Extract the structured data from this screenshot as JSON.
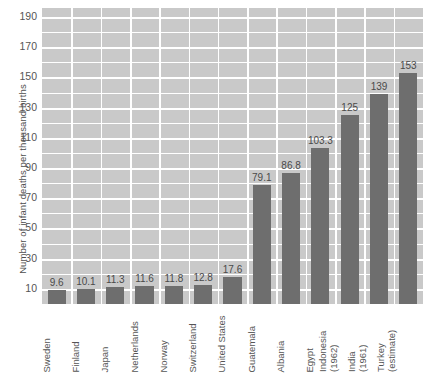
{
  "chart_data": {
    "type": "bar",
    "title": "",
    "xlabel": "",
    "ylabel": "Number of infant deaths per thousand births",
    "ylim": [
      0,
      196
    ],
    "yticks": [
      10,
      30,
      50,
      70,
      90,
      110,
      130,
      150,
      170,
      190
    ],
    "ytick_labels": [
      "10",
      "30",
      "50",
      "70",
      "90",
      "110",
      "130",
      "150",
      "170",
      "190"
    ],
    "minor_tick_step": 10,
    "grid": true,
    "legend": "none",
    "bar_color": "#6e6e6e",
    "plot_background": "#c9c9c9",
    "gridline_color": "#ffffff",
    "categories": [
      "Sweden",
      "Finland",
      "Japan",
      "Netherlands",
      "Norway",
      "Switzerland",
      "United States",
      "Guatemala",
      "Albania",
      "Egypt",
      "Indonesia (1962)",
      "India (1961)",
      "Turkey (estimate)"
    ],
    "category_lines": [
      [
        "Sweden"
      ],
      [
        "Finland"
      ],
      [
        "Japan"
      ],
      [
        "Netherlands"
      ],
      [
        "Norway"
      ],
      [
        "Switzerland"
      ],
      [
        "United States"
      ],
      [
        "Guatemala"
      ],
      [
        "Albania"
      ],
      [
        "Egypt"
      ],
      [
        "Indonesia",
        "(1962)"
      ],
      [
        "India",
        "(1961)"
      ],
      [
        "Turkey",
        "(estimate)"
      ]
    ],
    "values": [
      9.6,
      10.1,
      11.3,
      11.6,
      11.8,
      12.8,
      17.6,
      79.1,
      86.8,
      103.3,
      125,
      139,
      153
    ],
    "value_labels": [
      "9.6",
      "10.1",
      "11.3",
      "11.6",
      "11.8",
      "12.8",
      "17.6",
      "79.1",
      "86.8",
      "103.3",
      "125",
      "139",
      "153"
    ]
  }
}
